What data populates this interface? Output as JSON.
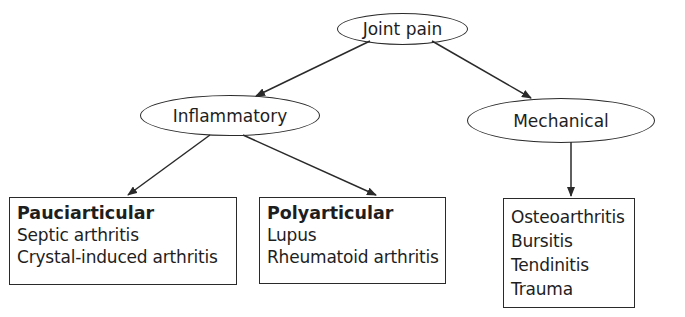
{
  "root": {
    "label": "Joint pain"
  },
  "categories": [
    {
      "label": "Inflammatory"
    },
    {
      "label": "Mechanical"
    }
  ],
  "leaves": {
    "pauciarticular": {
      "title": "Pauciarticular",
      "items": [
        "Septic arthritis",
        "Crystal-induced arthritis"
      ]
    },
    "polyarticular": {
      "title": "Polyarticular",
      "items": [
        "Lupus",
        "Rheumatoid arthritis"
      ]
    },
    "mechanical": {
      "items": [
        "Osteoarthritis",
        "Bursitis",
        "Tendinitis",
        "Trauma"
      ]
    }
  },
  "colors": {
    "line": "#2a2a2a",
    "text": "#1e1e1e",
    "background": "#ffffff"
  }
}
